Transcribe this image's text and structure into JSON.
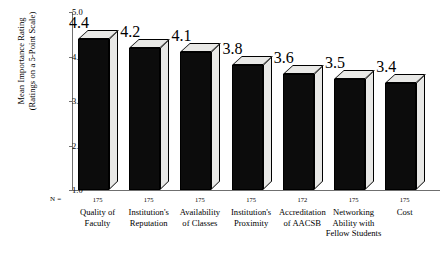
{
  "chart_data": {
    "type": "bar",
    "title": "",
    "xlabel": "",
    "ylabel": "Mean Importance Rating (Ratings on a 5-Point Scale)",
    "ylabel_lines": [
      "Mean Importance Rating",
      "(Ratings on a 5-Point Scale)"
    ],
    "ylim": [
      1.0,
      5.0
    ],
    "yticks": [
      "1.0",
      "2.0",
      "3.0",
      "4.0",
      "5.0"
    ],
    "ytick_values": [
      1.0,
      2.0,
      3.0,
      4.0,
      5.0
    ],
    "grid": false,
    "legend": "none",
    "n_label": "N =",
    "categories": [
      "Quality of Faculty",
      "Institution's Reputation",
      "Availability of Classes",
      "Institution's Proximity",
      "Accreditation of AACSB",
      "Networking Ability with Fellow Students",
      "Cost"
    ],
    "category_lines": [
      [
        "Quality of",
        "Faculty"
      ],
      [
        "Institution's",
        "Reputation"
      ],
      [
        "Availability",
        "of Classes"
      ],
      [
        "Institution's",
        "Proximity"
      ],
      [
        "Accreditation",
        "of AACSB"
      ],
      [
        "Networking",
        "Ability with",
        "Fellow Students"
      ],
      [
        "Cost"
      ]
    ],
    "values": [
      4.4,
      4.2,
      4.1,
      3.8,
      3.6,
      3.5,
      3.4
    ],
    "value_labels": [
      "4.4",
      "4.2",
      "4.1",
      "3.8",
      "3.6",
      "3.5",
      "3.4"
    ],
    "n_counts": [
      "175",
      "175",
      "175",
      "175",
      "172",
      "175",
      "175"
    ],
    "colors": {
      "bar_front": "#0c0c0c",
      "bar_top": "#e8e8e6",
      "bar_side": "#e8e8e6",
      "axis": "#6f6f6f",
      "background": "#ffffff",
      "text": "#000000"
    }
  }
}
